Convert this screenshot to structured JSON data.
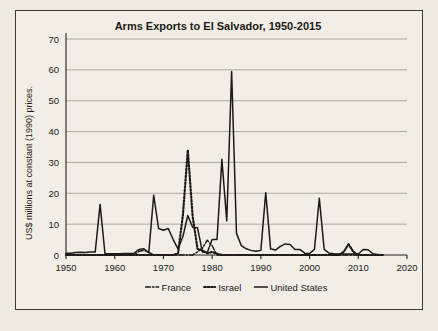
{
  "figure": {
    "background_color": "#f2eee5",
    "border_color": "#3b3a33",
    "page_background": "#efeadf"
  },
  "chart_data": {
    "type": "line",
    "title": "Arms Exports to El Salvador, 1950-2015",
    "xlabel": "",
    "ylabel": "US$ millions at constant (1990) prices.",
    "xlim": [
      1950,
      2020
    ],
    "ylim": [
      0,
      70
    ],
    "xticks": [
      1950,
      1960,
      1970,
      1980,
      1990,
      2000,
      2010,
      2020
    ],
    "yticks": [
      0,
      10,
      20,
      30,
      40,
      50,
      60,
      70
    ],
    "grid": "horizontal",
    "legend_position": "bottom-center",
    "series": [
      {
        "name": "France",
        "style": "dash-dot",
        "color": "#1c1a16",
        "x": [
          1950,
          1951,
          1952,
          1953,
          1954,
          1955,
          1956,
          1957,
          1958,
          1959,
          1960,
          1961,
          1962,
          1963,
          1964,
          1965,
          1966,
          1967,
          1968,
          1969,
          1970,
          1971,
          1972,
          1973,
          1974,
          1975,
          1976,
          1977,
          1978,
          1979,
          1980,
          1981,
          1982,
          1983,
          1984,
          1985,
          1986,
          1987,
          1988,
          1989,
          1990,
          1991,
          1992,
          1993,
          1994,
          1995,
          1996,
          1997,
          1998,
          1999,
          2000,
          2001,
          2002,
          2003,
          2004,
          2005,
          2006,
          2007,
          2008,
          2009,
          2010,
          2011,
          2012,
          2013,
          2014,
          2015
        ],
        "values": [
          0,
          0,
          0,
          0,
          0,
          0,
          0,
          0,
          0,
          0,
          0,
          0,
          0,
          0,
          0,
          1.2,
          1.5,
          0.8,
          0,
          0,
          0,
          0,
          0,
          0,
          0,
          0,
          0,
          1.0,
          2.2,
          4.8,
          3.0,
          0,
          0,
          0,
          0,
          0,
          0,
          0,
          0,
          0,
          0,
          0,
          0,
          0,
          0,
          0,
          0,
          0,
          0,
          0,
          0,
          0,
          0,
          0,
          0,
          0,
          0,
          0,
          0,
          0,
          0,
          0,
          0,
          0,
          0,
          0
        ]
      },
      {
        "name": "Israel",
        "style": "dotted",
        "color": "#1c1a16",
        "x": [
          1950,
          1951,
          1952,
          1953,
          1954,
          1955,
          1956,
          1957,
          1958,
          1959,
          1960,
          1961,
          1962,
          1963,
          1964,
          1965,
          1966,
          1967,
          1968,
          1969,
          1970,
          1971,
          1972,
          1973,
          1974,
          1975,
          1976,
          1977,
          1978,
          1979,
          1980,
          1981,
          1982,
          1983,
          1984,
          1985,
          1986,
          1987,
          1988,
          1989,
          1990,
          1991,
          1992,
          1993,
          1994,
          1995,
          1996,
          1997,
          1998,
          1999,
          2000,
          2001,
          2002,
          2003,
          2004,
          2005,
          2006,
          2007,
          2008,
          2009,
          2010,
          2011,
          2012,
          2013,
          2014,
          2015
        ],
        "values": [
          0,
          0,
          0,
          0,
          0,
          0,
          0,
          0,
          0,
          0,
          0,
          0,
          0,
          0,
          0,
          0,
          0,
          0,
          0,
          0,
          0,
          0,
          0,
          0.5,
          13.0,
          34.0,
          12.5,
          2.0,
          1.5,
          0.6,
          1.0,
          0.4,
          0,
          0,
          0,
          0,
          0,
          0,
          0,
          0,
          0,
          0,
          0,
          0,
          0,
          0,
          0,
          0,
          0,
          0,
          0,
          0,
          0,
          0,
          0,
          0,
          0,
          1.0,
          3.5,
          1.0,
          0,
          0,
          0,
          0,
          0,
          0
        ]
      },
      {
        "name": "United States",
        "style": "solid",
        "color": "#1c1a16",
        "x": [
          1950,
          1951,
          1952,
          1953,
          1954,
          1955,
          1956,
          1957,
          1958,
          1959,
          1960,
          1961,
          1962,
          1963,
          1964,
          1965,
          1966,
          1967,
          1968,
          1969,
          1970,
          1971,
          1972,
          1973,
          1974,
          1975,
          1976,
          1977,
          1978,
          1979,
          1980,
          1981,
          1982,
          1983,
          1984,
          1985,
          1986,
          1987,
          1988,
          1989,
          1990,
          1991,
          1992,
          1993,
          1994,
          1995,
          1996,
          1997,
          1998,
          1999,
          2000,
          2001,
          2002,
          2003,
          2004,
          2005,
          2006,
          2007,
          2008,
          2009,
          2010,
          2011,
          2012,
          2013,
          2014,
          2015
        ],
        "values": [
          0.6,
          0.6,
          0.8,
          0.9,
          0.8,
          1.0,
          1.0,
          16.4,
          0.5,
          0.4,
          0.4,
          0.4,
          0.5,
          0.5,
          0.6,
          1.8,
          2.0,
          0.8,
          19.4,
          8.6,
          8.0,
          8.6,
          5.0,
          2.0,
          6.0,
          12.8,
          9.0,
          8.8,
          1.0,
          0.8,
          5.0,
          5.0,
          31.0,
          11.0,
          59.5,
          7.0,
          3.0,
          2.0,
          1.5,
          1.2,
          1.5,
          20.2,
          2.0,
          1.6,
          2.8,
          3.6,
          3.4,
          1.8,
          1.8,
          0.6,
          0.5,
          1.8,
          18.4,
          1.8,
          0.6,
          0.4,
          0.3,
          0.3,
          0.3,
          0.3,
          0.3,
          1.8,
          1.7,
          0.4,
          0.2,
          0
        ]
      }
    ]
  },
  "legend": {
    "items": [
      {
        "label": "France",
        "style": "dash-dot"
      },
      {
        "label": "Israel",
        "style": "dotted"
      },
      {
        "label": "United States",
        "style": "solid"
      }
    ]
  }
}
